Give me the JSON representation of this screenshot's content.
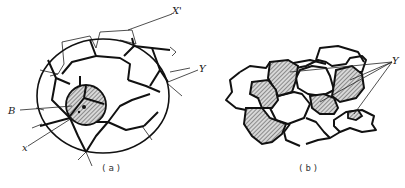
{
  "figure": {
    "panel_a": {
      "caption": "(a)",
      "labels": {
        "x_prime": "X'",
        "y": "Y",
        "b": "B",
        "x": "x"
      }
    },
    "panel_b": {
      "caption": "(b)",
      "labels": {
        "y": "Y"
      }
    },
    "colors": {
      "line": "#111111",
      "hatch": "#555555",
      "background": "#ffffff"
    }
  }
}
